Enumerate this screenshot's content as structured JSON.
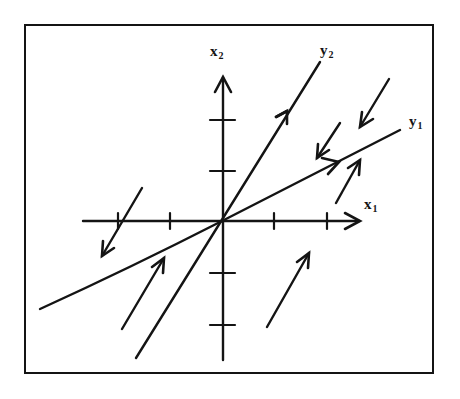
{
  "figure": {
    "type": "phase-portrait",
    "colors": {
      "ink": "#141414",
      "background": "#ffffff"
    },
    "axes": {
      "x1": {
        "label_main": "x",
        "label_sub": "1",
        "tick_count_each_side": 2
      },
      "x2": {
        "label_main": "x",
        "label_sub": "2",
        "tick_count_each_side": 2
      }
    },
    "eigen_lines": {
      "y1": {
        "label_main": "y",
        "label_sub": "1",
        "direction": "shallow slope, arrow pointing outward (up-right)"
      },
      "y2": {
        "label_main": "y",
        "label_sub": "2",
        "direction": "steep slope, arrow pointing outward (up-right)"
      }
    },
    "trajectory_arrows": [
      {
        "quadrant": "upper-right",
        "direction": "down-left",
        "position": "above y1, outer"
      },
      {
        "quadrant": "upper-right",
        "direction": "down-left",
        "position": "above y1, inner"
      },
      {
        "quadrant": "upper-right",
        "direction": "up-right",
        "position": "below y1"
      },
      {
        "quadrant": "lower-right",
        "direction": "up-right",
        "position": "below x1 axis"
      },
      {
        "quadrant": "lower-left",
        "direction": "up-right",
        "position": "between y1 and y2"
      },
      {
        "quadrant": "left",
        "direction": "down-left",
        "position": "crossing x1 axis near left tick"
      }
    ]
  }
}
